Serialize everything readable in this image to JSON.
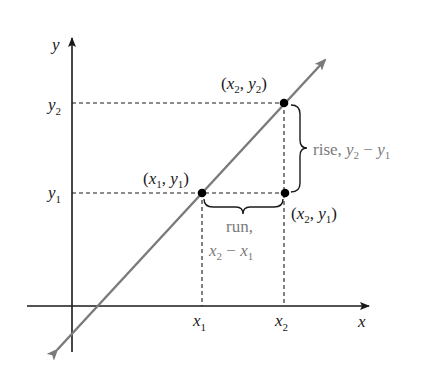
{
  "diagram": {
    "type": "slope-of-line",
    "colors": {
      "axis": "#1a1a1a",
      "line": "#7a7a7a",
      "dashed": "#1a1a1a",
      "point": "#000000",
      "brace": "#1a1a1a",
      "annotation_text": "#7a7a7a"
    },
    "axes": {
      "x_label": "x",
      "y_label": "y"
    },
    "ticks": {
      "x1": {
        "base": "x",
        "sub": "1"
      },
      "x2": {
        "base": "x",
        "sub": "2"
      },
      "y1": {
        "base": "y",
        "sub": "1"
      },
      "y2": {
        "base": "y",
        "sub": "2"
      }
    },
    "points": [
      {
        "id": "p1",
        "label": "(x1, y1)",
        "base1": "x",
        "sub1": "1",
        "base2": "y",
        "sub2": "1"
      },
      {
        "id": "p2",
        "label": "(x2, y2)",
        "base1": "x",
        "sub1": "2",
        "base2": "y",
        "sub2": "2"
      },
      {
        "id": "p3",
        "label": "(x2, y1)",
        "base1": "x",
        "sub1": "2",
        "base2": "y",
        "sub2": "1"
      }
    ],
    "rise": {
      "word": "rise,",
      "expr": "y2 − y1",
      "a": "y",
      "a_sub": "2",
      "op": "−",
      "b": "y",
      "b_sub": "1"
    },
    "run": {
      "word": "run,",
      "expr": "x2 − x1",
      "a": "x",
      "a_sub": "2",
      "op": "−",
      "b": "x",
      "b_sub": "1"
    },
    "punct": {
      "open": "(",
      "comma": ", ",
      "close": ")"
    }
  }
}
